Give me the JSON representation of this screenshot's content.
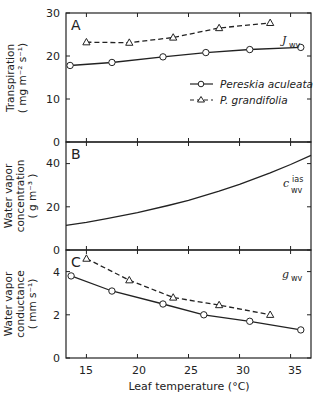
{
  "chart_data": [
    {
      "panel": "A",
      "type": "line",
      "ylabel": "Transpiration",
      "yunits": "(mg m⁻² s⁻¹)",
      "ylim": [
        0,
        30
      ],
      "yticks": [
        "0",
        "10",
        "20",
        "30"
      ],
      "xlim": [
        13,
        37
      ],
      "annotation": {
        "main": "J",
        "sub": "wv"
      },
      "series": [
        {
          "name": "Pereskia aculeata",
          "style": "solid-circle",
          "x": [
            13.4,
            17.5,
            22.5,
            26.7,
            31.0,
            36.0
          ],
          "y": [
            17.8,
            18.5,
            19.8,
            20.8,
            21.5,
            22.0
          ]
        },
        {
          "name": "P. grandifolia",
          "style": "dashed-triangle",
          "x": [
            15.0,
            19.2,
            23.5,
            28.0,
            33.0
          ],
          "y": [
            23.2,
            23.1,
            24.3,
            26.5,
            27.7
          ]
        }
      ],
      "legend": [
        "Pereskia aculeata",
        "P. grandifolia"
      ]
    },
    {
      "panel": "B",
      "type": "line",
      "ylabel_lines": [
        "Water vapor",
        "concentration",
        "(g m⁻³)"
      ],
      "ylim": [
        0,
        50
      ],
      "yticks": [
        "0",
        "20",
        "40"
      ],
      "xlim": [
        13,
        37
      ],
      "annotation": {
        "main": "c",
        "sup": "ias",
        "sub": "wv"
      },
      "series": [
        {
          "name": "c_wv^ias",
          "style": "solid",
          "x": [
            13,
            15,
            17,
            20,
            23,
            25,
            28,
            30,
            33,
            35,
            37
          ],
          "y": [
            11.4,
            12.8,
            14.5,
            17.3,
            20.6,
            23.0,
            27.2,
            30.4,
            35.7,
            39.6,
            43.8
          ]
        }
      ]
    },
    {
      "panel": "C",
      "type": "line",
      "ylabel_lines": [
        "Water vapor",
        "conductance",
        "(mm s⁻¹)"
      ],
      "ylim": [
        0,
        5
      ],
      "yticks": [
        "0",
        "2",
        "4"
      ],
      "xlim": [
        13,
        37
      ],
      "xticks": [
        "15",
        "20",
        "25",
        "30",
        "35"
      ],
      "xlabel": "Leaf temperature (°C)",
      "annotation": {
        "main": "g",
        "sub": "wv"
      },
      "series": [
        {
          "name": "Pereskia aculeata",
          "style": "solid-circle",
          "x": [
            13.5,
            17.5,
            22.5,
            26.5,
            31.0,
            36.0
          ],
          "y": [
            3.8,
            3.1,
            2.5,
            2.0,
            1.7,
            1.3
          ]
        },
        {
          "name": "P. grandifolia",
          "style": "dashed-triangle",
          "x": [
            15.0,
            19.2,
            23.5,
            28.0,
            33.0
          ],
          "y": [
            4.6,
            3.6,
            2.8,
            2.45,
            2.0
          ]
        }
      ]
    }
  ],
  "labels": {
    "panelA": "A",
    "panelB": "B",
    "panelC": "C",
    "a_ylabel1": "Transpiration",
    "a_ylabel2": "( mg m⁻² s⁻¹)",
    "b_ylabel1": "Water vapor",
    "b_ylabel2": "concentration",
    "b_ylabel3": "( g m⁻³ )",
    "c_ylabel1": "Water vapor",
    "c_ylabel2": "conductance",
    "c_ylabel3": "( mm s⁻¹)",
    "xlabel": "Leaf temperature (°C)",
    "legend1": "Pereskia aculeata",
    "legend2": "P. grandifolia",
    "annoA_main": "J",
    "annoA_sub": "wv",
    "annoB_main": "c",
    "annoB_sup": "ias",
    "annoB_sub": "wv",
    "annoC_main": "g",
    "annoC_sub": "wv"
  },
  "ticks": {
    "a": [
      "30",
      "20",
      "10",
      "0"
    ],
    "b": [
      "40",
      "20",
      "0"
    ],
    "c": [
      "4",
      "2",
      "0"
    ],
    "x": [
      "15",
      "20",
      "25",
      "30",
      "35"
    ]
  }
}
